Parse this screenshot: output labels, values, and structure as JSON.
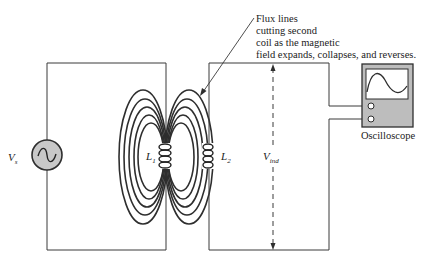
{
  "figure": {
    "annotation": {
      "lines": [
        "Flux lines",
        "cutting second",
        "coil as the magnetic",
        "field expands, collapses, and reverses."
      ]
    },
    "source": {
      "label_main": "V",
      "label_sub": "s",
      "icon": "ac-sine-icon"
    },
    "coil_primary": {
      "label_main": "L",
      "label_sub": "1"
    },
    "coil_secondary": {
      "label_main": "L",
      "label_sub": "2"
    },
    "induced_voltage": {
      "label_main": "V",
      "label_sub": "ind"
    },
    "oscilloscope": {
      "label": "Oscilloscope",
      "screen_trace": "sine-wave",
      "body_color": "#bdbdbd",
      "screen_color": "#ffffff"
    },
    "colors": {
      "line": "#2e2e2e",
      "source_fill": "#c8c8c8",
      "background": "#ffffff"
    }
  }
}
